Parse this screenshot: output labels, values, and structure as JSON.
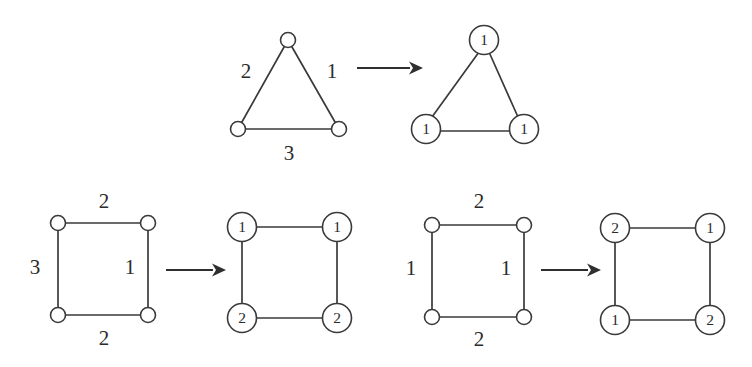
{
  "figure": {
    "background_color": "#ffffff",
    "ink_color": "#2b2b2b",
    "caption": "",
    "rows": [
      {
        "name": "triangle-row",
        "source": {
          "shape": "triangle",
          "edge_labels": {
            "left": "2",
            "right": "1",
            "bottom": "3"
          },
          "vertices": [
            "",
            "",
            ""
          ]
        },
        "arrow": {
          "glyph": "→"
        },
        "result": {
          "shape": "triangle",
          "vertex_labels": {
            "apex": "1",
            "bottom_left": "1",
            "bottom_right": "1"
          }
        }
      },
      {
        "name": "square-row-left",
        "source": {
          "shape": "square",
          "edge_labels": {
            "top": "2",
            "left": "3",
            "right": "1",
            "bottom": "2"
          },
          "vertices": [
            "",
            "",
            "",
            ""
          ]
        },
        "arrow": {
          "glyph": "→"
        },
        "result": {
          "shape": "square",
          "vertex_labels": {
            "top_left": "1",
            "top_right": "1",
            "bottom_left": "2",
            "bottom_right": "2"
          }
        }
      },
      {
        "name": "square-row-right",
        "source": {
          "shape": "square",
          "edge_labels": {
            "top": "2",
            "left": "1",
            "right": "1",
            "bottom": "2"
          },
          "vertices": [
            "",
            "",
            "",
            ""
          ]
        },
        "arrow": {
          "glyph": "→"
        },
        "result": {
          "shape": "square",
          "vertex_labels": {
            "top_left": "2",
            "top_right": "1",
            "bottom_left": "1",
            "bottom_right": "2"
          }
        }
      }
    ]
  }
}
